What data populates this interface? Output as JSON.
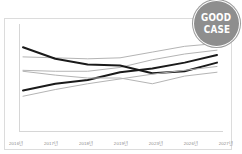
{
  "badge": {
    "line1": "GOOD",
    "line2": "CASE",
    "color": "#8e8e8e"
  },
  "chart_data": {
    "type": "line",
    "title": "",
    "xlabel": "",
    "ylabel": "",
    "grid": false,
    "legend_position": "bottom",
    "categories": [
      "2016년",
      "2017년",
      "2018년",
      "2019년",
      "2023년",
      "2026년",
      "2027년"
    ],
    "x": [
      0,
      1,
      2,
      3,
      4,
      5,
      6
    ],
    "ylim": [
      0,
      100
    ],
    "series": [
      {
        "name": "전국",
        "color": "#b4b4b4",
        "width": 1,
        "values": [
          72,
          71,
          70,
          71,
          77,
          83,
          86
        ]
      },
      {
        "name": "서울",
        "color": "#b4b4b4",
        "width": 1,
        "values": [
          58,
          57,
          57,
          61,
          69,
          75,
          79
        ]
      },
      {
        "name": "경기",
        "color": "#1a1a1a",
        "width": 2,
        "values": [
          82,
          70,
          64,
          63,
          55,
          57,
          66
        ]
      },
      {
        "name": "강원",
        "color": "#1a1a1a",
        "width": 2,
        "values": [
          37,
          44,
          48,
          56,
          60,
          66,
          74
        ]
      },
      {
        "name": "경상",
        "color": "#b4b4b4",
        "width": 1,
        "values": [
          57,
          53,
          50,
          50,
          44,
          52,
          56
        ]
      },
      {
        "name": "충북",
        "color": "#b4b4b4",
        "width": 1,
        "values": [
          31,
          38,
          44,
          49,
          54,
          58,
          62
        ]
      }
    ]
  }
}
